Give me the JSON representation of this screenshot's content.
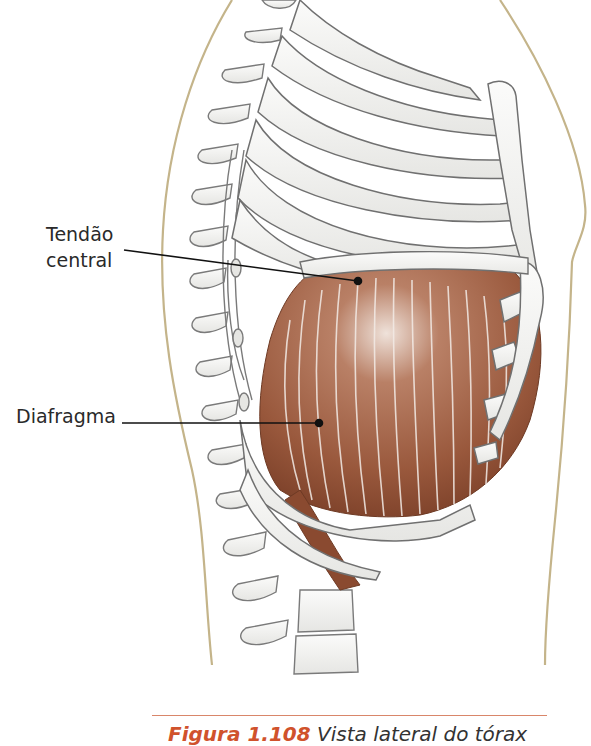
{
  "figure": {
    "labels": {
      "central_tendon_line1": "Tendão",
      "central_tendon_line2": "central",
      "diaphragm": "Diafragma"
    },
    "caption": {
      "number": "Figura 1.108",
      "text": "Vista lateral do tórax"
    },
    "colors": {
      "muscle": "#9a5a3e",
      "muscle_dark": "#7a3f28",
      "bone_outline": "#6f6f6f",
      "bone_fill": "#f4f4f2",
      "body_outline": "#c4b48a",
      "leader_line": "#111111",
      "caption_accent": "#d0522c",
      "caption_rule": "#d9866a"
    }
  }
}
